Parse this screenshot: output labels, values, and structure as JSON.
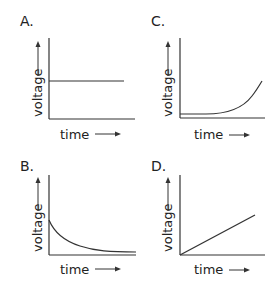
{
  "figure": {
    "panels": [
      {
        "id": "A",
        "label": "A.",
        "ylabel": "voltage",
        "xlabel": "time",
        "shape": "constant"
      },
      {
        "id": "B",
        "label": "B.",
        "ylabel": "voltage",
        "xlabel": "time",
        "shape": "exponential-decay"
      },
      {
        "id": "C",
        "label": "C.",
        "ylabel": "voltage",
        "xlabel": "time",
        "shape": "exponential-growth"
      },
      {
        "id": "D",
        "label": "D.",
        "ylabel": "voltage",
        "xlabel": "time",
        "shape": "linear-increase"
      }
    ],
    "line_color": "#333333"
  }
}
